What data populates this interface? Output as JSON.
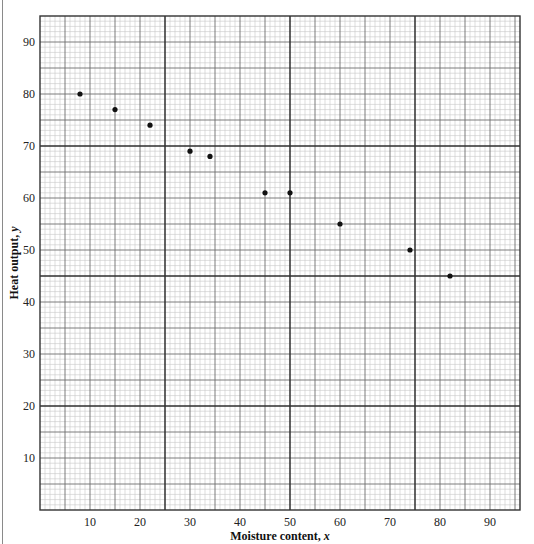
{
  "chart_data": {
    "type": "scatter",
    "title": "",
    "xlabel": "Moisture content, x",
    "xlabel_text": "Moisture content, ",
    "xlabel_var": "x",
    "ylabel": "Heat output, y",
    "ylabel_text": "Heat output, ",
    "ylabel_var": "y",
    "xlim": [
      0,
      96
    ],
    "ylim": [
      0,
      95
    ],
    "xticks": [
      10,
      20,
      30,
      40,
      50,
      60,
      70,
      80,
      90
    ],
    "yticks": [
      10,
      20,
      30,
      40,
      50,
      60,
      70,
      80,
      90
    ],
    "grid": true,
    "grid_style": "graph paper: minor every 1 unit, medium every 5 units, heavy x at 25/50/75 and y at 20/45/70/95",
    "legend": null,
    "points": [
      {
        "x": 8,
        "y": 80
      },
      {
        "x": 15,
        "y": 77
      },
      {
        "x": 22,
        "y": 74
      },
      {
        "x": 30,
        "y": 69
      },
      {
        "x": 34,
        "y": 68
      },
      {
        "x": 45,
        "y": 61
      },
      {
        "x": 50,
        "y": 61
      },
      {
        "x": 60,
        "y": 55
      },
      {
        "x": 74,
        "y": 50
      },
      {
        "x": 82,
        "y": 45
      }
    ],
    "x": [
      8,
      15,
      22,
      30,
      34,
      45,
      50,
      60,
      74,
      82
    ],
    "y": [
      80,
      77,
      74,
      69,
      68,
      61,
      61,
      55,
      50,
      45
    ]
  },
  "colors": {
    "minor_grid": "#c8c8c8",
    "medium_grid": "#6e6e6e",
    "heavy_grid": "#2e2e2e",
    "point": "#111111",
    "text": "#222222"
  }
}
